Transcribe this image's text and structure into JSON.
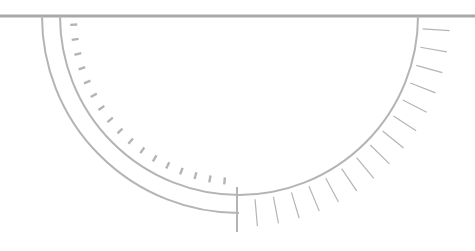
{
  "diagram": {
    "type": "semicircular-gauge-line-drawing",
    "colors": {
      "background": "#ffffff",
      "stroke": "#b4b4b4",
      "baseline": "#a8a8a8"
    },
    "baseline": {
      "y": 16,
      "x1": 0,
      "x2": 475
    },
    "center": {
      "x": 239,
      "y": 16
    },
    "inner_arc": {
      "radius": 179,
      "start_deg": 180,
      "end_deg": 360
    },
    "outer_arc": {
      "radius": 197,
      "start_deg": 180,
      "end_deg": 270
    },
    "center_marker": {
      "x": 237,
      "y1": 187,
      "y2": 232
    },
    "left_ticks": {
      "count": 17,
      "start_deg": 183,
      "end_deg": 265,
      "inset_from": 10,
      "length": 7,
      "width": 2.4
    },
    "right_ticks": {
      "count": 15,
      "start_deg": 275,
      "end_deg": 356,
      "offset_from": 5,
      "length": 27,
      "width": 1.2
    }
  }
}
